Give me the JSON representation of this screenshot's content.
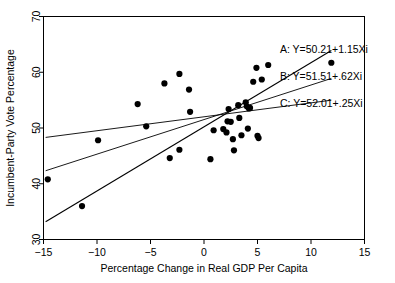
{
  "chart_data": {
    "type": "scatter",
    "title": "",
    "xlabel": "Percentage Change in Real GDP Per Capita",
    "ylabel": "Incumbent-Party Vote Percentage",
    "xlim": [
      -15,
      15
    ],
    "ylim": [
      30,
      70
    ],
    "xticks": [
      -15,
      -10,
      -5,
      0,
      5,
      10,
      15
    ],
    "xtick_labels": [
      "−15",
      "−10",
      "−5",
      "0",
      "5",
      "10",
      "15"
    ],
    "yticks": [
      30,
      40,
      50,
      60,
      70
    ],
    "ytick_labels": [
      "30",
      "40",
      "50",
      "60",
      "70"
    ],
    "grid": false,
    "legend_position": "inside-top-right",
    "points": [
      {
        "x": -14.6,
        "y": 40.8
      },
      {
        "x": -11.4,
        "y": 36.0
      },
      {
        "x": -9.9,
        "y": 47.8
      },
      {
        "x": -6.2,
        "y": 54.3
      },
      {
        "x": -5.4,
        "y": 50.3
      },
      {
        "x": -3.7,
        "y": 58.0
      },
      {
        "x": -3.2,
        "y": 44.6
      },
      {
        "x": -2.3,
        "y": 59.7
      },
      {
        "x": -2.3,
        "y": 46.1
      },
      {
        "x": -1.4,
        "y": 56.9
      },
      {
        "x": -1.3,
        "y": 52.9
      },
      {
        "x": 0.6,
        "y": 44.4
      },
      {
        "x": 0.9,
        "y": 49.6
      },
      {
        "x": 1.8,
        "y": 49.8
      },
      {
        "x": 2.1,
        "y": 49.2
      },
      {
        "x": 2.2,
        "y": 51.2
      },
      {
        "x": 2.3,
        "y": 53.4
      },
      {
        "x": 2.5,
        "y": 51.1
      },
      {
        "x": 2.7,
        "y": 48.0
      },
      {
        "x": 2.8,
        "y": 46.0
      },
      {
        "x": 3.2,
        "y": 54.1
      },
      {
        "x": 3.3,
        "y": 51.8
      },
      {
        "x": 3.5,
        "y": 48.7
      },
      {
        "x": 3.9,
        "y": 54.6
      },
      {
        "x": 4.0,
        "y": 53.9
      },
      {
        "x": 4.1,
        "y": 49.9
      },
      {
        "x": 4.2,
        "y": 53.5
      },
      {
        "x": 4.3,
        "y": 53.6
      },
      {
        "x": 4.6,
        "y": 58.3
      },
      {
        "x": 4.9,
        "y": 60.8
      },
      {
        "x": 5.0,
        "y": 48.6
      },
      {
        "x": 5.1,
        "y": 48.2
      },
      {
        "x": 5.4,
        "y": 58.7
      },
      {
        "x": 6.0,
        "y": 61.3
      },
      {
        "x": 11.9,
        "y": 61.7
      }
    ],
    "fit_lines": [
      {
        "id": "A",
        "label": "A: Y=50.21+1.15Xi",
        "intercept": 50.21,
        "slope": 1.15,
        "x_start": -14.8,
        "x_end": 11.9,
        "width": 1.1
      },
      {
        "id": "B",
        "label": "B: Y=51.51+.62Xi",
        "intercept": 51.51,
        "slope": 0.62,
        "x_start": -14.8,
        "x_end": 11.9,
        "width": 0.9
      },
      {
        "id": "C",
        "label": "C: Y=52.01+.25Xi",
        "intercept": 52.01,
        "slope": 0.25,
        "x_start": -14.8,
        "x_end": 11.9,
        "width": 0.9
      }
    ],
    "annotations": [
      {
        "id": "A",
        "text": "A: Y=50.21+1.15Xi",
        "x": 7.1,
        "y": 64.2
      },
      {
        "id": "B",
        "text": "B: Y=51.51+.62Xi",
        "x": 7.1,
        "y": 59.4
      },
      {
        "id": "C",
        "text": "C: Y=52.01+.25Xi",
        "x": 7.1,
        "y": 54.4
      }
    ],
    "marker": {
      "shape": "circle",
      "radius_px": 3.1,
      "color": "#000000"
    }
  }
}
